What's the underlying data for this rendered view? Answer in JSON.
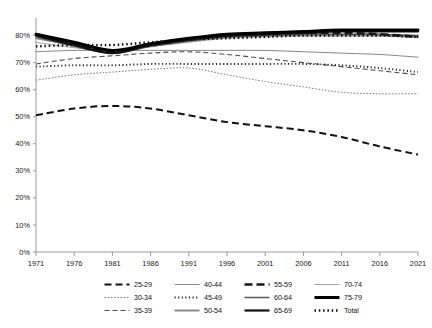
{
  "chart_data": {
    "type": "line",
    "title": "",
    "subtitle": "",
    "xlabel": "",
    "ylabel": "",
    "xlim": [
      1971,
      2021
    ],
    "ylim": [
      0,
      0.85
    ],
    "y_tick_labels": [
      "0%",
      "10%",
      "20%",
      "30%",
      "40%",
      "50%",
      "60%",
      "70%",
      "80%"
    ],
    "y_tick_values": [
      0,
      10,
      20,
      30,
      40,
      50,
      60,
      70,
      80
    ],
    "x_tick_labels": [
      "1971",
      "1976",
      "1981",
      "1986",
      "1991",
      "1996",
      "2001",
      "2006",
      "2011",
      "2016",
      "2021"
    ],
    "x_tick_values": [
      1971,
      1976,
      1981,
      1986,
      1991,
      1996,
      2001,
      2006,
      2011,
      2016,
      2021
    ],
    "grid": false,
    "legend_position": "bottom",
    "legend_columns": 4,
    "x": [
      1971,
      1976,
      1981,
      1986,
      1991,
      1996,
      2001,
      2006,
      2011,
      2016,
      2021
    ],
    "series": [
      {
        "name": "25-29",
        "style": "dashed-thick",
        "color": "#111111",
        "width": 2.0,
        "dash": "7,4",
        "values": [
          50.5,
          53.0,
          54.0,
          53.0,
          50.5,
          48.0,
          46.5,
          45.0,
          42.5,
          39.0,
          36.0
        ]
      },
      {
        "name": "30-34",
        "style": "dotted-thin",
        "color": "#6f6f6f",
        "width": 0.9,
        "dash": "1.6,1.6",
        "values": [
          63.5,
          65.5,
          66.5,
          67.5,
          68.0,
          65.5,
          63.0,
          61.0,
          59.0,
          58.5,
          58.5
        ]
      },
      {
        "name": "35-39",
        "style": "dashed-thin",
        "color": "#4d4d4d",
        "width": 1.1,
        "dash": "5,3",
        "values": [
          69.5,
          71.5,
          72.5,
          73.5,
          74.0,
          73.0,
          71.5,
          70.0,
          68.5,
          67.0,
          65.5
        ]
      },
      {
        "name": "40-44",
        "style": "solid-thin",
        "color": "#7a7a7a",
        "width": 0.9,
        "dash": "",
        "values": [
          74.0,
          74.5,
          74.5,
          74.5,
          74.5,
          74.5,
          74.5,
          74.0,
          73.5,
          73.0,
          72.0
        ]
      },
      {
        "name": "45-49",
        "style": "dotted-medium",
        "color": "#2b2b2b",
        "width": 1.9,
        "dash": "1.2,2.4",
        "values": [
          68.5,
          69.0,
          69.0,
          69.5,
          69.5,
          69.5,
          69.5,
          69.5,
          69.0,
          68.0,
          66.5
        ]
      },
      {
        "name": "50-54",
        "style": "solid-thick-gray",
        "color": "#8a8a8a",
        "width": 2.0,
        "dash": "",
        "values": [
          79.0,
          76.5,
          74.0,
          76.0,
          78.0,
          79.5,
          80.0,
          80.0,
          80.0,
          80.0,
          79.5
        ]
      },
      {
        "name": "55-59",
        "style": "dashed-heavy",
        "color": "#171717",
        "width": 2.6,
        "dash": "8,4",
        "values": [
          80.5,
          77.0,
          74.0,
          76.5,
          78.5,
          80.0,
          80.5,
          81.0,
          81.0,
          80.5,
          79.5
        ]
      },
      {
        "name": "60-64",
        "style": "solid-medium-gray",
        "color": "#5a5a5a",
        "width": 1.5,
        "dash": "",
        "values": [
          79.5,
          76.0,
          73.5,
          76.0,
          78.0,
          79.5,
          80.0,
          80.5,
          80.5,
          80.5,
          80.0
        ]
      },
      {
        "name": "65-69",
        "style": "solid-thick-black",
        "color": "#111111",
        "width": 2.2,
        "dash": "",
        "values": [
          80.0,
          76.5,
          73.5,
          76.5,
          78.5,
          80.0,
          80.5,
          81.0,
          81.5,
          81.5,
          81.5
        ]
      },
      {
        "name": "70-74",
        "style": "solid-thin-light",
        "color": "#9a9a9a",
        "width": 0.9,
        "dash": "",
        "values": [
          77.5,
          75.5,
          74.5,
          76.0,
          77.5,
          79.0,
          79.5,
          80.0,
          80.0,
          80.0,
          79.5
        ]
      },
      {
        "name": "75-79",
        "style": "solid-extra-thick",
        "color": "#000000",
        "width": 3.0,
        "dash": "",
        "values": [
          80.5,
          77.5,
          74.5,
          77.0,
          79.0,
          80.5,
          81.0,
          81.5,
          82.0,
          82.0,
          82.0
        ]
      },
      {
        "name": "Total",
        "style": "dotted-heavy",
        "color": "#0d0d0d",
        "width": 2.4,
        "dash": "1.5,2.8",
        "values": [
          76.0,
          76.5,
          76.5,
          77.5,
          78.5,
          79.0,
          79.5,
          80.0,
          80.0,
          80.0,
          79.5
        ]
      }
    ]
  },
  "legend": {
    "items": [
      {
        "label": "25-29"
      },
      {
        "label": "30-34"
      },
      {
        "label": "35-39"
      },
      {
        "label": "40-44"
      },
      {
        "label": "45-49"
      },
      {
        "label": "50-54"
      },
      {
        "label": "55-59"
      },
      {
        "label": "60-64"
      },
      {
        "label": "65-69"
      },
      {
        "label": "70-74"
      },
      {
        "label": "75-79"
      },
      {
        "label": "Total"
      }
    ]
  },
  "colors": {
    "axis": "#9b9b9b",
    "text": "#1a1a1a",
    "background": "#ffffff"
  }
}
